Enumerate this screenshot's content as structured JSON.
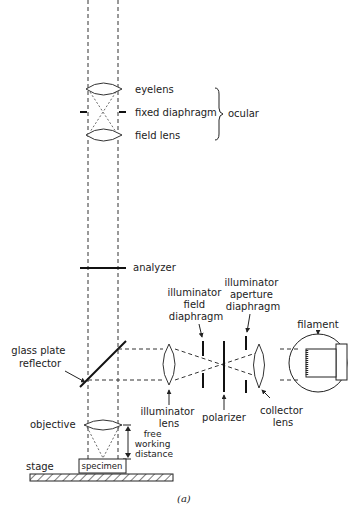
{
  "figure": {
    "caption": "(a)",
    "labels": {
      "eyelens": "eyelens",
      "fixed_diaphragm": "fixed diaphragm",
      "field_lens": "field lens",
      "ocular": "ocular",
      "analyzer": "analyzer",
      "illuminator_field_diaphragm": [
        "illuminator",
        "field",
        "diaphragm"
      ],
      "illuminator_aperture_diaphragm": [
        "illuminator",
        "aperture",
        "diaphragm"
      ],
      "filament": "filament",
      "glass_plate_reflector": [
        "glass plate",
        "reflector"
      ],
      "illuminator_lens": [
        "illuminator",
        "lens"
      ],
      "polarizer": "polarizer",
      "collector_lens": [
        "collector",
        "lens"
      ],
      "objective": "objective",
      "free_working_distance": [
        "free",
        "working",
        "distance"
      ],
      "stage": "stage",
      "specimen": "specimen"
    },
    "colors": {
      "ink": "#222222",
      "background": "#ffffff"
    }
  }
}
